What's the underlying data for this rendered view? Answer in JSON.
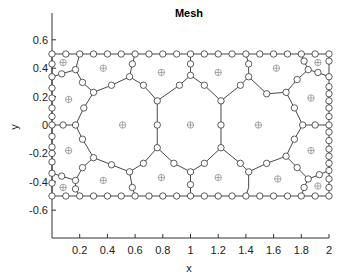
{
  "chart_data": {
    "type": "scatter",
    "title": "Mesh",
    "xlabel": "x",
    "ylabel": "y",
    "xlim": [
      0,
      2
    ],
    "ylim": [
      -0.8,
      0.8
    ],
    "xticks": [
      "0.2",
      "0.4",
      "0.6",
      "0.8",
      "1",
      "1.2",
      "1.4",
      "1.6",
      "1.8",
      "2"
    ],
    "xtick_values": [
      0.2,
      0.4,
      0.6,
      0.8,
      1.0,
      1.2,
      1.4,
      1.6,
      1.8,
      2.0
    ],
    "yticks": [
      "0.6",
      "0.4",
      "0.2",
      "0",
      "-0.2",
      "-0.4",
      "-0.6"
    ],
    "ytick_values": [
      0.6,
      0.4,
      0.2,
      0.0,
      -0.2,
      -0.4,
      -0.6
    ],
    "grid": false,
    "legend": null,
    "domain_rectangle": {
      "x": [
        0,
        2
      ],
      "y": [
        -0.5,
        0.5
      ]
    },
    "series": [
      {
        "name": "boundary nodes",
        "marker": "circle",
        "points": [
          [
            0.0,
            0.5
          ],
          [
            0.1,
            0.5
          ],
          [
            0.2,
            0.5
          ],
          [
            0.3,
            0.5
          ],
          [
            0.4,
            0.5
          ],
          [
            0.5,
            0.5
          ],
          [
            0.6,
            0.5
          ],
          [
            0.7,
            0.5
          ],
          [
            0.8,
            0.5
          ],
          [
            0.9,
            0.5
          ],
          [
            1.0,
            0.5
          ],
          [
            1.1,
            0.5
          ],
          [
            1.2,
            0.5
          ],
          [
            1.3,
            0.5
          ],
          [
            1.4,
            0.5
          ],
          [
            1.5,
            0.5
          ],
          [
            1.6,
            0.5
          ],
          [
            1.7,
            0.5
          ],
          [
            1.8,
            0.5
          ],
          [
            1.9,
            0.5
          ],
          [
            2.0,
            0.5
          ],
          [
            0.0,
            -0.5
          ],
          [
            0.1,
            -0.5
          ],
          [
            0.2,
            -0.5
          ],
          [
            0.3,
            -0.5
          ],
          [
            0.4,
            -0.5
          ],
          [
            0.5,
            -0.5
          ],
          [
            0.6,
            -0.5
          ],
          [
            0.7,
            -0.5
          ],
          [
            0.8,
            -0.5
          ],
          [
            0.9,
            -0.5
          ],
          [
            1.0,
            -0.5
          ],
          [
            1.1,
            -0.5
          ],
          [
            1.2,
            -0.5
          ],
          [
            1.3,
            -0.5
          ],
          [
            1.4,
            -0.5
          ],
          [
            1.5,
            -0.5
          ],
          [
            1.6,
            -0.5
          ],
          [
            1.7,
            -0.5
          ],
          [
            1.8,
            -0.5
          ],
          [
            1.9,
            -0.5
          ],
          [
            2.0,
            -0.5
          ],
          [
            0.0,
            0.43
          ],
          [
            0.0,
            0.34
          ],
          [
            0.0,
            0.26
          ],
          [
            0.0,
            0.19
          ],
          [
            0.0,
            0.12
          ],
          [
            0.0,
            0.06
          ],
          [
            0.0,
            0.0
          ],
          [
            0.0,
            -0.08
          ],
          [
            0.0,
            -0.155
          ],
          [
            0.0,
            -0.2
          ],
          [
            0.0,
            -0.26
          ],
          [
            0.0,
            -0.34
          ],
          [
            0.0,
            -0.41
          ],
          [
            2.0,
            0.45
          ],
          [
            2.0,
            0.34
          ],
          [
            2.0,
            0.27
          ],
          [
            2.0,
            0.22
          ],
          [
            2.0,
            0.17
          ],
          [
            2.0,
            0.12
          ],
          [
            2.0,
            0.06
          ],
          [
            2.0,
            0.0
          ],
          [
            2.0,
            -0.05
          ],
          [
            2.0,
            -0.11
          ],
          [
            2.0,
            -0.17
          ],
          [
            2.0,
            -0.22
          ],
          [
            2.0,
            -0.27
          ],
          [
            2.0,
            -0.32
          ],
          [
            2.0,
            -0.38
          ],
          [
            2.0,
            -0.44
          ]
        ]
      },
      {
        "name": "interior nodes",
        "marker": "circle",
        "points": [
          [
            0.17,
            0.39
          ],
          [
            0.07,
            0.36
          ],
          [
            0.22,
            0.3
          ],
          [
            0.3,
            0.23
          ],
          [
            0.43,
            0.28
          ],
          [
            0.56,
            0.34
          ],
          [
            0.58,
            0.43
          ],
          [
            0.23,
            0.12
          ],
          [
            0.17,
            0.0
          ],
          [
            0.08,
            0.0
          ],
          [
            0.22,
            -0.1
          ],
          [
            0.3,
            -0.23
          ],
          [
            0.22,
            -0.3
          ],
          [
            0.17,
            -0.39
          ],
          [
            0.07,
            -0.36
          ],
          [
            0.17,
            -0.45
          ],
          [
            0.43,
            -0.28
          ],
          [
            0.56,
            -0.33
          ],
          [
            0.58,
            -0.44
          ],
          [
            0.76,
            0.17
          ],
          [
            0.66,
            0.28
          ],
          [
            0.92,
            0.28
          ],
          [
            1.0,
            0.35
          ],
          [
            1.0,
            0.43
          ],
          [
            1.22,
            0.17
          ],
          [
            1.1,
            0.28
          ],
          [
            1.36,
            0.28
          ],
          [
            1.42,
            0.34
          ],
          [
            1.42,
            0.43
          ],
          [
            0.76,
            0.0
          ],
          [
            0.76,
            -0.16
          ],
          [
            1.22,
            0.0
          ],
          [
            1.22,
            -0.16
          ],
          [
            0.66,
            -0.27
          ],
          [
            0.88,
            -0.27
          ],
          [
            1.1,
            -0.27
          ],
          [
            1.0,
            -0.33
          ],
          [
            1.0,
            -0.42
          ],
          [
            1.36,
            -0.27
          ],
          [
            1.42,
            -0.33
          ],
          [
            1.55,
            0.22
          ],
          [
            1.69,
            0.23
          ],
          [
            1.77,
            0.32
          ],
          [
            1.85,
            0.39
          ],
          [
            1.92,
            0.37
          ],
          [
            1.82,
            0.45
          ],
          [
            1.75,
            0.12
          ],
          [
            1.81,
            0.0
          ],
          [
            1.9,
            0.0
          ],
          [
            1.75,
            -0.1
          ],
          [
            1.69,
            -0.22
          ],
          [
            1.55,
            -0.27
          ],
          [
            1.77,
            -0.3
          ],
          [
            1.85,
            -0.38
          ],
          [
            1.93,
            -0.35
          ],
          [
            1.82,
            -0.44
          ]
        ]
      },
      {
        "name": "cell centers",
        "marker": "circled-plus",
        "points": [
          [
            0.08,
            0.44
          ],
          [
            0.37,
            0.4
          ],
          [
            0.12,
            0.18
          ],
          [
            0.79,
            0.37
          ],
          [
            1.2,
            0.37
          ],
          [
            1.62,
            0.4
          ],
          [
            1.92,
            0.44
          ],
          [
            1.87,
            0.19
          ],
          [
            0.51,
            0.0
          ],
          [
            1.0,
            0.0
          ],
          [
            1.49,
            0.0
          ],
          [
            0.12,
            -0.18
          ],
          [
            0.37,
            -0.39
          ],
          [
            0.08,
            -0.44
          ],
          [
            0.79,
            -0.37
          ],
          [
            1.2,
            -0.37
          ],
          [
            1.63,
            -0.38
          ],
          [
            1.87,
            -0.18
          ],
          [
            1.92,
            -0.43
          ]
        ]
      }
    ],
    "edges": [
      [
        [
          0.2,
          0.5
        ],
        [
          0.17,
          0.39
        ]
      ],
      [
        [
          0.17,
          0.39
        ],
        [
          0.07,
          0.36
        ]
      ],
      [
        [
          0.07,
          0.36
        ],
        [
          0.0,
          0.34
        ]
      ],
      [
        [
          0.17,
          0.39
        ],
        [
          0.22,
          0.3
        ]
      ],
      [
        [
          0.22,
          0.3
        ],
        [
          0.3,
          0.23
        ]
      ],
      [
        [
          0.3,
          0.23
        ],
        [
          0.43,
          0.28
        ]
      ],
      [
        [
          0.43,
          0.28
        ],
        [
          0.56,
          0.34
        ]
      ],
      [
        [
          0.56,
          0.34
        ],
        [
          0.58,
          0.43
        ]
      ],
      [
        [
          0.58,
          0.43
        ],
        [
          0.6,
          0.5
        ]
      ],
      [
        [
          0.3,
          0.23
        ],
        [
          0.23,
          0.12
        ]
      ],
      [
        [
          0.23,
          0.12
        ],
        [
          0.17,
          0.0
        ]
      ],
      [
        [
          0.17,
          0.0
        ],
        [
          0.08,
          0.0
        ]
      ],
      [
        [
          0.08,
          0.0
        ],
        [
          0.0,
          0.0
        ]
      ],
      [
        [
          0.17,
          0.0
        ],
        [
          0.22,
          -0.1
        ]
      ],
      [
        [
          0.22,
          -0.1
        ],
        [
          0.3,
          -0.23
        ]
      ],
      [
        [
          0.3,
          -0.23
        ],
        [
          0.22,
          -0.3
        ]
      ],
      [
        [
          0.22,
          -0.3
        ],
        [
          0.17,
          -0.39
        ]
      ],
      [
        [
          0.17,
          -0.39
        ],
        [
          0.07,
          -0.36
        ]
      ],
      [
        [
          0.07,
          -0.36
        ],
        [
          0.0,
          -0.34
        ]
      ],
      [
        [
          0.17,
          -0.39
        ],
        [
          0.17,
          -0.45
        ]
      ],
      [
        [
          0.17,
          -0.45
        ],
        [
          0.2,
          -0.5
        ]
      ],
      [
        [
          0.3,
          -0.23
        ],
        [
          0.43,
          -0.28
        ]
      ],
      [
        [
          0.43,
          -0.28
        ],
        [
          0.56,
          -0.33
        ]
      ],
      [
        [
          0.56,
          -0.33
        ],
        [
          0.58,
          -0.44
        ]
      ],
      [
        [
          0.58,
          -0.44
        ],
        [
          0.6,
          -0.5
        ]
      ],
      [
        [
          0.56,
          0.34
        ],
        [
          0.66,
          0.28
        ]
      ],
      [
        [
          0.66,
          0.28
        ],
        [
          0.76,
          0.17
        ]
      ],
      [
        [
          0.76,
          0.17
        ],
        [
          0.92,
          0.28
        ]
      ],
      [
        [
          0.92,
          0.28
        ],
        [
          1.0,
          0.35
        ]
      ],
      [
        [
          1.0,
          0.35
        ],
        [
          1.0,
          0.43
        ]
      ],
      [
        [
          1.0,
          0.43
        ],
        [
          1.0,
          0.5
        ]
      ],
      [
        [
          1.0,
          0.35
        ],
        [
          1.1,
          0.28
        ]
      ],
      [
        [
          1.1,
          0.28
        ],
        [
          1.22,
          0.17
        ]
      ],
      [
        [
          1.22,
          0.17
        ],
        [
          1.36,
          0.28
        ]
      ],
      [
        [
          1.36,
          0.28
        ],
        [
          1.42,
          0.34
        ]
      ],
      [
        [
          1.42,
          0.34
        ],
        [
          1.42,
          0.43
        ]
      ],
      [
        [
          1.42,
          0.43
        ],
        [
          1.4,
          0.5
        ]
      ],
      [
        [
          0.76,
          0.17
        ],
        [
          0.76,
          0.0
        ]
      ],
      [
        [
          0.76,
          0.0
        ],
        [
          0.76,
          -0.16
        ]
      ],
      [
        [
          1.22,
          0.17
        ],
        [
          1.22,
          0.0
        ]
      ],
      [
        [
          1.22,
          0.0
        ],
        [
          1.22,
          -0.16
        ]
      ],
      [
        [
          0.56,
          -0.33
        ],
        [
          0.66,
          -0.27
        ]
      ],
      [
        [
          0.66,
          -0.27
        ],
        [
          0.76,
          -0.16
        ]
      ],
      [
        [
          0.76,
          -0.16
        ],
        [
          0.88,
          -0.27
        ]
      ],
      [
        [
          0.88,
          -0.27
        ],
        [
          1.0,
          -0.33
        ]
      ],
      [
        [
          1.0,
          -0.33
        ],
        [
          1.0,
          -0.42
        ]
      ],
      [
        [
          1.0,
          -0.42
        ],
        [
          1.0,
          -0.5
        ]
      ],
      [
        [
          1.0,
          -0.33
        ],
        [
          1.1,
          -0.27
        ]
      ],
      [
        [
          1.1,
          -0.27
        ],
        [
          1.22,
          -0.16
        ]
      ],
      [
        [
          1.22,
          -0.16
        ],
        [
          1.36,
          -0.27
        ]
      ],
      [
        [
          1.36,
          -0.27
        ],
        [
          1.42,
          -0.33
        ]
      ],
      [
        [
          1.42,
          -0.33
        ],
        [
          1.42,
          -0.44
        ]
      ],
      [
        [
          1.42,
          -0.44
        ],
        [
          1.4,
          -0.5
        ]
      ],
      [
        [
          1.42,
          0.34
        ],
        [
          1.55,
          0.22
        ]
      ],
      [
        [
          1.55,
          0.22
        ],
        [
          1.69,
          0.23
        ]
      ],
      [
        [
          1.69,
          0.23
        ],
        [
          1.77,
          0.32
        ]
      ],
      [
        [
          1.77,
          0.32
        ],
        [
          1.85,
          0.39
        ]
      ],
      [
        [
          1.85,
          0.39
        ],
        [
          1.82,
          0.45
        ]
      ],
      [
        [
          1.82,
          0.45
        ],
        [
          1.8,
          0.5
        ]
      ],
      [
        [
          1.85,
          0.39
        ],
        [
          1.92,
          0.37
        ]
      ],
      [
        [
          1.92,
          0.37
        ],
        [
          2.0,
          0.34
        ]
      ],
      [
        [
          1.69,
          0.23
        ],
        [
          1.75,
          0.12
        ]
      ],
      [
        [
          1.75,
          0.12
        ],
        [
          1.81,
          0.0
        ]
      ],
      [
        [
          1.81,
          0.0
        ],
        [
          1.9,
          0.0
        ]
      ],
      [
        [
          1.9,
          0.0
        ],
        [
          2.0,
          0.0
        ]
      ],
      [
        [
          1.81,
          0.0
        ],
        [
          1.75,
          -0.1
        ]
      ],
      [
        [
          1.75,
          -0.1
        ],
        [
          1.69,
          -0.22
        ]
      ],
      [
        [
          1.69,
          -0.22
        ],
        [
          1.55,
          -0.27
        ]
      ],
      [
        [
          1.55,
          -0.27
        ],
        [
          1.42,
          -0.33
        ]
      ],
      [
        [
          1.69,
          -0.22
        ],
        [
          1.77,
          -0.3
        ]
      ],
      [
        [
          1.77,
          -0.3
        ],
        [
          1.85,
          -0.38
        ]
      ],
      [
        [
          1.85,
          -0.38
        ],
        [
          1.93,
          -0.35
        ]
      ],
      [
        [
          1.93,
          -0.35
        ],
        [
          2.0,
          -0.32
        ]
      ],
      [
        [
          1.85,
          -0.38
        ],
        [
          1.82,
          -0.44
        ]
      ],
      [
        [
          1.82,
          -0.44
        ],
        [
          1.8,
          -0.5
        ]
      ]
    ]
  }
}
